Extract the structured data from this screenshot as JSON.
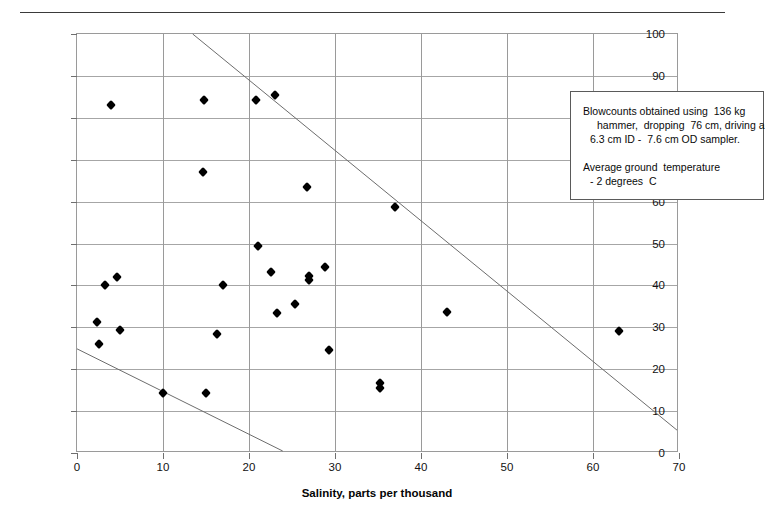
{
  "chart_data": {
    "type": "scatter",
    "title": "",
    "xlabel": "Salinity, parts per thousand",
    "ylabel": "Blowcounts, blows per 30 cm",
    "xlim": [
      0,
      70
    ],
    "ylim": [
      0,
      100
    ],
    "xticks": [
      0,
      10,
      20,
      30,
      40,
      50,
      60,
      70
    ],
    "yticks": [
      0,
      10,
      20,
      30,
      40,
      50,
      60,
      70,
      80,
      90,
      100
    ],
    "grid": true,
    "legend": "none",
    "marker": "filled-diamond",
    "marker_color": "#000000",
    "points": [
      {
        "x": 2.3,
        "y": 31.2
      },
      {
        "x": 2.6,
        "y": 26.0
      },
      {
        "x": 3.3,
        "y": 40.1
      },
      {
        "x": 4.0,
        "y": 83.0
      },
      {
        "x": 4.6,
        "y": 42.0
      },
      {
        "x": 5.0,
        "y": 29.3
      },
      {
        "x": 10.0,
        "y": 14.3
      },
      {
        "x": 14.6,
        "y": 67.1
      },
      {
        "x": 14.8,
        "y": 84.2
      },
      {
        "x": 15.0,
        "y": 14.3
      },
      {
        "x": 16.3,
        "y": 28.3
      },
      {
        "x": 17.0,
        "y": 40.2
      },
      {
        "x": 20.8,
        "y": 84.3
      },
      {
        "x": 21.0,
        "y": 49.5
      },
      {
        "x": 22.5,
        "y": 43.3
      },
      {
        "x": 23.0,
        "y": 85.4
      },
      {
        "x": 23.2,
        "y": 33.3
      },
      {
        "x": 25.3,
        "y": 35.5
      },
      {
        "x": 26.8,
        "y": 63.4
      },
      {
        "x": 27.0,
        "y": 41.2
      },
      {
        "x": 27.0,
        "y": 42.2
      },
      {
        "x": 28.8,
        "y": 44.4
      },
      {
        "x": 29.3,
        "y": 24.5
      },
      {
        "x": 35.2,
        "y": 15.6
      },
      {
        "x": 35.2,
        "y": 16.6
      },
      {
        "x": 37.0,
        "y": 58.7
      },
      {
        "x": 43.0,
        "y": 33.6
      },
      {
        "x": 63.0,
        "y": 29.0
      }
    ],
    "trend_lines": [
      {
        "name": "upper-bound-line",
        "x1": 13.5,
        "y1": 100,
        "x2": 70.0,
        "y2": 5.0
      },
      {
        "name": "lower-bound-line",
        "x1": 0.0,
        "y1": 24.5,
        "x2": 24.0,
        "y2": 0.0
      }
    ]
  },
  "annotation": {
    "line1": "Blowcounts obtained using  136 kg",
    "line2": "hammer,  dropping  76 cm, driving a",
    "line3": "6.3 cm ID -  7.6 cm OD sampler.",
    "line4": "Average ground  temperature",
    "line5": "- 2 degrees  C"
  }
}
